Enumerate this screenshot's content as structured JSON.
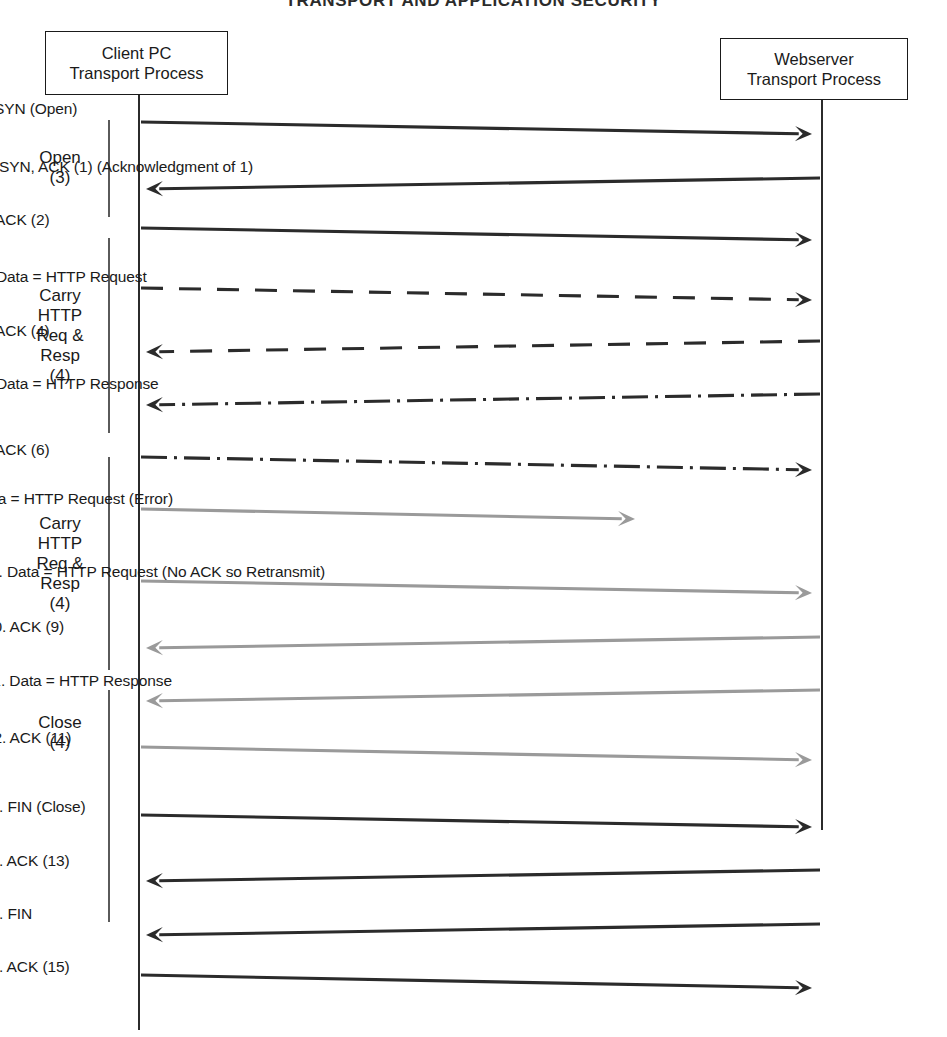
{
  "page": {
    "width": 947,
    "height": 1037,
    "background": "#ffffff",
    "cropped_header_text": "TRANSPORT AND APPLICATION SECURITY"
  },
  "colors": {
    "dark": "#1a1a1a",
    "line_dark": "#2b2b2b",
    "line_gray": "#9a9a9a",
    "phase_bar": "#5a5a5a",
    "box_border": "#1a1a1a",
    "background": "#ffffff"
  },
  "nodes": [
    {
      "name": "client-node",
      "line1": "Client PC",
      "line2": "Transport Process",
      "x": 45,
      "y": 31,
      "w": 183,
      "h": 64,
      "lifeline_x": 138
    },
    {
      "name": "server-node",
      "line1": "Webserver",
      "line2": "Transport Process",
      "x": 720,
      "y": 38,
      "w": 188,
      "h": 62,
      "lifeline_x": 821
    }
  ],
  "lifelines": [
    {
      "name": "client-lifeline",
      "x": 138,
      "y1": 95,
      "y2": 1030
    },
    {
      "name": "server-lifeline",
      "x": 821,
      "y1": 100,
      "y2": 830
    }
  ],
  "phases": [
    {
      "name": "phase-open",
      "lines": [
        "Open",
        "(3)"
      ],
      "bar_x": 108,
      "bar_y1": 120,
      "bar_y2": 217,
      "label_x": 18,
      "label_y": 148,
      "label_w": 84
    },
    {
      "name": "phase-carry-http-1",
      "lines": [
        "Carry",
        "HTTP",
        "Req &",
        "Resp",
        "(4)"
      ],
      "bar_x": 108,
      "bar_y1": 238,
      "bar_y2": 433,
      "label_x": 18,
      "label_y": 286,
      "label_w": 84
    },
    {
      "name": "phase-carry-http-2",
      "lines": [
        "Carry",
        "HTTP",
        "Req &",
        "Resp",
        "(4)"
      ],
      "bar_x": 108,
      "bar_y1": 457,
      "bar_y2": 670,
      "label_x": 18,
      "label_y": 514,
      "label_w": 84
    },
    {
      "name": "phase-close",
      "lines": [
        "Close",
        "(4)"
      ],
      "bar_x": 108,
      "bar_y1": 690,
      "bar_y2": 922,
      "label_x": 18,
      "label_y": 713,
      "label_w": 84
    }
  ],
  "messages": [
    {
      "seq": 1,
      "label": "1. SYN (Open)",
      "direction": "right",
      "style": "solid",
      "color": "#2b2b2b",
      "label_cx": 450,
      "label_y": 100,
      "x1": 141,
      "y1": 122,
      "x2": 812,
      "y2": 134
    },
    {
      "seq": 2,
      "label": "2. SYN, ACK (1) (Acknowledgment of 1)",
      "direction": "left",
      "style": "solid",
      "color": "#2b2b2b",
      "label_cx": 455,
      "label_y": 158,
      "x1": 820,
      "y1": 178,
      "x2": 146,
      "y2": 189
    },
    {
      "seq": 3,
      "label": "3. ACK (2)",
      "direction": "right",
      "style": "solid",
      "color": "#2b2b2b",
      "label_cx": 452,
      "label_y": 211,
      "x1": 141,
      "y1": 228,
      "x2": 812,
      "y2": 240
    },
    {
      "seq": 4,
      "label": "4. Data = HTTP Request",
      "direction": "right",
      "style": "dashed",
      "color": "#2b2b2b",
      "label_cx": 452,
      "label_y": 268,
      "x1": 141,
      "y1": 288,
      "x2": 812,
      "y2": 300
    },
    {
      "seq": 5,
      "label": "5. ACK (4)",
      "direction": "left",
      "style": "dashed",
      "color": "#2b2b2b",
      "label_cx": 452,
      "label_y": 322,
      "x1": 820,
      "y1": 341,
      "x2": 146,
      "y2": 352
    },
    {
      "seq": 6,
      "label": "6. Data = HTTP Response",
      "direction": "left",
      "style": "dashdot",
      "color": "#2b2b2b",
      "label_cx": 452,
      "label_y": 375,
      "x1": 820,
      "y1": 394,
      "x2": 146,
      "y2": 405
    },
    {
      "seq": 7,
      "label": "7. ACK (6)",
      "direction": "right",
      "style": "dashdot",
      "color": "#2b2b2b",
      "label_cx": 452,
      "label_y": 441,
      "x1": 141,
      "y1": 457,
      "x2": 812,
      "y2": 470
    },
    {
      "seq": 8,
      "label": "8. Data = HTTP Request (Error)",
      "direction": "right",
      "style": "solid",
      "color": "#9a9a9a",
      "label_cx": 430,
      "label_y": 490,
      "x1": 141,
      "y1": 509,
      "x2": 635,
      "y2": 519
    },
    {
      "seq": 9,
      "label": "9. Data = HTTP Request (No ACK so Retransmit)",
      "direction": "right",
      "style": "solid",
      "color": "#9a9a9a",
      "label_cx": 463,
      "label_y": 563,
      "x1": 141,
      "y1": 581,
      "x2": 812,
      "y2": 593
    },
    {
      "seq": 10,
      "label": "10. ACK (9)",
      "direction": "left",
      "style": "solid",
      "color": "#9a9a9a",
      "label_cx": 458,
      "label_y": 618,
      "x1": 820,
      "y1": 637,
      "x2": 146,
      "y2": 648
    },
    {
      "seq": 11,
      "label": "11. Data = HTTP Response",
      "direction": "left",
      "style": "solid",
      "color": "#9a9a9a",
      "label_cx": 458,
      "label_y": 672,
      "x1": 820,
      "y1": 690,
      "x2": 146,
      "y2": 701
    },
    {
      "seq": 12,
      "label": "12. ACK (11)",
      "direction": "right",
      "style": "solid",
      "color": "#9a9a9a",
      "label_cx": 458,
      "label_y": 729,
      "x1": 141,
      "y1": 747,
      "x2": 812,
      "y2": 760
    },
    {
      "seq": 13,
      "label": "13. FIN (Close)",
      "direction": "right",
      "style": "solid",
      "color": "#2b2b2b",
      "label_cx": 455,
      "label_y": 798,
      "x1": 141,
      "y1": 815,
      "x2": 812,
      "y2": 827
    },
    {
      "seq": 14,
      "label": "14. ACK (13)",
      "direction": "left",
      "style": "solid",
      "color": "#2b2b2b",
      "label_cx": 455,
      "label_y": 852,
      "x1": 820,
      "y1": 870,
      "x2": 146,
      "y2": 881
    },
    {
      "seq": 15,
      "label": "15. FIN",
      "direction": "left",
      "style": "solid",
      "color": "#2b2b2b",
      "label_cx": 455,
      "label_y": 905,
      "x1": 820,
      "y1": 924,
      "x2": 146,
      "y2": 935
    },
    {
      "seq": 16,
      "label": "16. ACK (15)",
      "direction": "right",
      "style": "solid",
      "color": "#2b2b2b",
      "label_cx": 455,
      "label_y": 958,
      "x1": 141,
      "y1": 975,
      "x2": 812,
      "y2": 988
    }
  ]
}
